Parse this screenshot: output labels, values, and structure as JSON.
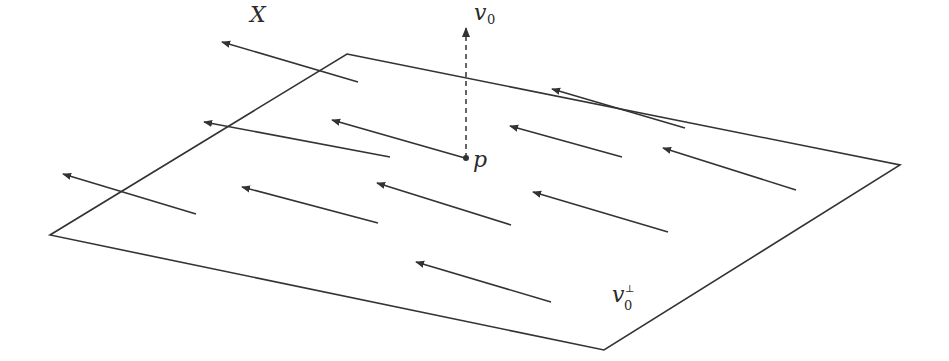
{
  "figure": {
    "type": "vector-field-on-plane",
    "colors": {
      "stroke": "#333333",
      "background": "#ffffff"
    },
    "plane": {
      "label": "v",
      "label_sub": "0",
      "label_sup": "⊥",
      "label_pos": [
        612,
        302
      ],
      "vertices": [
        [
          347,
          54
        ],
        [
          900,
          165
        ],
        [
          604,
          350
        ],
        [
          50,
          235
        ]
      ]
    },
    "point": {
      "label": "p",
      "pos": [
        466,
        158
      ]
    },
    "normal_vector": {
      "label": "v",
      "label_sub": "0",
      "from": [
        466,
        158
      ],
      "to": [
        466,
        28
      ],
      "style": "dashed"
    },
    "field_label": {
      "text": "X",
      "pos": [
        250,
        22
      ]
    },
    "arrows": [
      {
        "from": [
          358,
          82
        ],
        "to": [
          222,
          42
        ]
      },
      {
        "from": [
          465,
          158
        ],
        "to": [
          332,
          120
        ]
      },
      {
        "from": [
          685,
          128
        ],
        "to": [
          552,
          89
        ]
      },
      {
        "from": [
          390,
          157
        ],
        "to": [
          204,
          122
        ]
      },
      {
        "from": [
          622,
          157
        ],
        "to": [
          510,
          126
        ]
      },
      {
        "from": [
          796,
          190
        ],
        "to": [
          663,
          148
        ]
      },
      {
        "from": [
          196,
          214
        ],
        "to": [
          63,
          174
        ]
      },
      {
        "from": [
          378,
          223
        ],
        "to": [
          242,
          187
        ]
      },
      {
        "from": [
          511,
          225
        ],
        "to": [
          377,
          183
        ]
      },
      {
        "from": [
          668,
          232
        ],
        "to": [
          533,
          192
        ]
      },
      {
        "from": [
          551,
          302
        ],
        "to": [
          416,
          262
        ]
      }
    ]
  }
}
